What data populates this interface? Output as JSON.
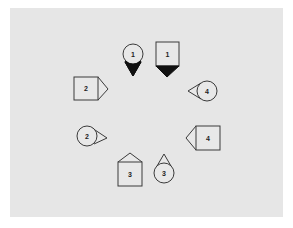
{
  "diagram": {
    "background_color": "#ffffff",
    "panel_color": "#e6e6e6",
    "stroke_color": "#3a3a3a",
    "filled_pointer_color": "#111111",
    "markers": [
      {
        "id": "circle-1",
        "shape": "circle",
        "label": "1",
        "pointer_direction": "down",
        "pointer_filled": true
      },
      {
        "id": "square-1",
        "shape": "square",
        "label": "1",
        "pointer_direction": "down",
        "pointer_filled": true
      },
      {
        "id": "square-2",
        "shape": "square",
        "label": "2",
        "pointer_direction": "right",
        "pointer_filled": false
      },
      {
        "id": "circle-4",
        "shape": "circle",
        "label": "4",
        "pointer_direction": "left",
        "pointer_filled": false
      },
      {
        "id": "circle-2",
        "shape": "circle",
        "label": "2",
        "pointer_direction": "right",
        "pointer_filled": false
      },
      {
        "id": "square-4",
        "shape": "square",
        "label": "4",
        "pointer_direction": "left",
        "pointer_filled": false
      },
      {
        "id": "square-3",
        "shape": "square",
        "label": "3",
        "pointer_direction": "up",
        "pointer_filled": false
      },
      {
        "id": "circle-3",
        "shape": "circle",
        "label": "3",
        "pointer_direction": "up",
        "pointer_filled": false
      }
    ]
  }
}
